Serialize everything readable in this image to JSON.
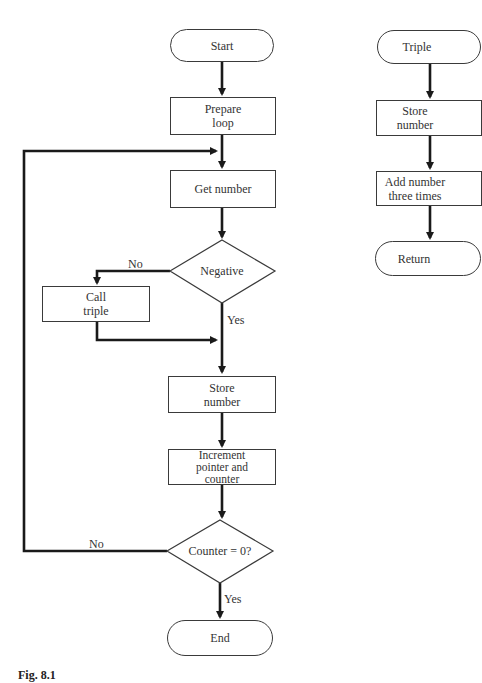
{
  "main_flow": {
    "start": "Start",
    "prepare_loop": "Prepare\nloop",
    "get_number": "Get number",
    "negative_decision": "Negative",
    "negative_no_label": "No",
    "negative_yes_label": "Yes",
    "call_triple": "Call\ntriple",
    "store_number": "Store\nnumber",
    "increment": "Increment\npointer and\ncounter",
    "counter_decision": "Counter = 0?",
    "counter_no_label": "No",
    "counter_yes_label": "Yes",
    "end": "End"
  },
  "subroutine": {
    "start": "Triple",
    "store_number": "Store\nnumber",
    "add_number": "Add number\nthree times",
    "return": "Return"
  },
  "caption": "Fig. 8.1",
  "colors": {
    "line": "#1a1a1a",
    "border": "#3a3a3a",
    "background": "#ffffff"
  }
}
